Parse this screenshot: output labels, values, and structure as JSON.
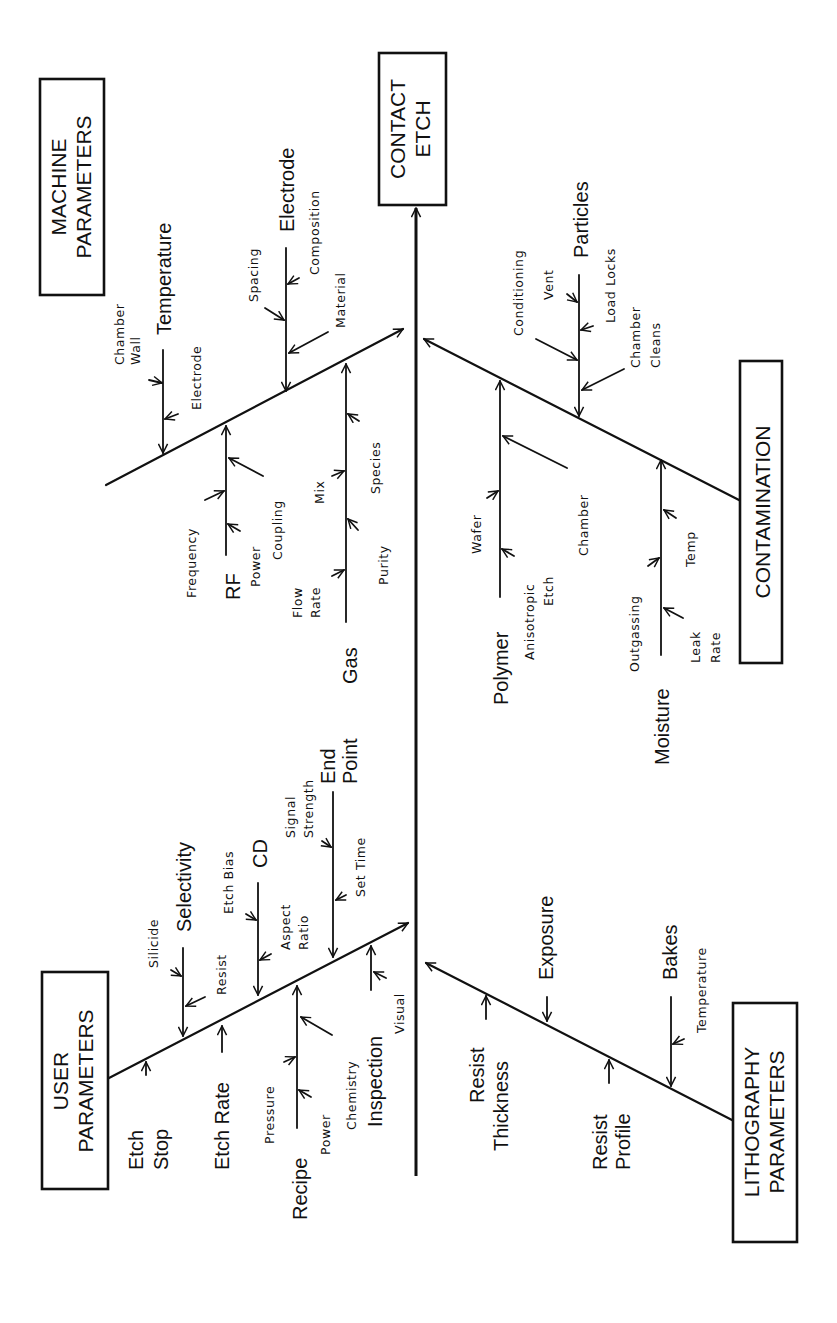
{
  "diagram": {
    "type": "fishbone",
    "orientation": "rotated 90 degrees counter-clockwise",
    "effect": {
      "line1": "CONTACT",
      "line2": "ETCH"
    },
    "categories": {
      "machine": {
        "line1": "MACHINE",
        "line2": "PARAMETERS",
        "causes": {
          "temperature": {
            "label": "Temperature",
            "subs": {
              "chamber_wall_1": "Chamber",
              "chamber_wall_2": "Wall",
              "electrode": "Electrode"
            }
          },
          "electrode": {
            "label": "Electrode",
            "subs": {
              "spacing": "Spacing",
              "composition": "Composition",
              "material": "Material"
            }
          },
          "rf": {
            "label": "RF",
            "subs": {
              "frequency": "Frequency",
              "power": "Power",
              "coupling": "Coupling"
            }
          },
          "gas": {
            "label": "Gas",
            "subs": {
              "flow_rate_1": "Flow",
              "flow_rate_2": "Rate",
              "mix": "Mix",
              "purity": "Purity",
              "species": "Species"
            }
          }
        }
      },
      "contamination": {
        "line1": "CONTAMINATION",
        "causes": {
          "particles": {
            "label": "Particles",
            "subs": {
              "conditioning": "Conditioning",
              "vent": "Vent",
              "load_locks": "Load Locks",
              "chamber_cleans_1": "Chamber",
              "chamber_cleans_2": "Cleans"
            }
          },
          "polymer": {
            "label": "Polymer",
            "subs": {
              "wafer": "Wafer",
              "anisotropic_etch_1": "Anisotropic",
              "anisotropic_etch_2": "Etch",
              "chamber": "Chamber"
            }
          },
          "moisture": {
            "label": "Moisture",
            "subs": {
              "outgassing": "Outgassing",
              "temp": "Temp",
              "leak_rate_1": "Leak",
              "leak_rate_2": "Rate"
            }
          }
        }
      },
      "user": {
        "line1": "USER",
        "line2": "PARAMETERS",
        "causes": {
          "etch_stop": {
            "label1": "Etch",
            "label2": "Stop"
          },
          "selectivity": {
            "label": "Selectivity",
            "subs": {
              "silicide": "Silicide",
              "resist": "Resist"
            }
          },
          "etch_rate": {
            "label": "Etch Rate"
          },
          "cd": {
            "label": "CD",
            "subs": {
              "etch_bias": "Etch Bias",
              "aspect_ratio_1": "Aspect",
              "aspect_ratio_2": "Ratio"
            }
          },
          "recipe": {
            "label": "Recipe",
            "subs": {
              "pressure": "Pressure",
              "power": "Power",
              "chemistry": "Chemistry"
            }
          },
          "end_point": {
            "label1": "End",
            "label2": "Point",
            "subs": {
              "signal_strength_1": "Signal",
              "signal_strength_2": "Strength",
              "set_time": "Set Time"
            }
          },
          "inspection": {
            "label": "Inspection",
            "subs": {
              "visual": "Visual"
            }
          }
        }
      },
      "lithography": {
        "line1": "LITHOGRAPHY",
        "line2": "PARAMETERS",
        "causes": {
          "resist_thickness": {
            "label1": "Resist",
            "label2": "Thickness"
          },
          "exposure": {
            "label": "Exposure"
          },
          "resist_profile": {
            "label1": "Resist",
            "label2": "Profile"
          },
          "bakes": {
            "label": "Bakes",
            "subs": {
              "temperature": "Temperature"
            }
          }
        }
      }
    }
  }
}
